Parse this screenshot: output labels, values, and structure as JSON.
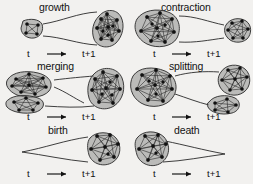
{
  "figure": {
    "caption_absent": true,
    "background_color": "#f2f1ef",
    "ink_color": "#131313",
    "blob_fill": "#9a9a98",
    "panel_count": 6,
    "axis": {
      "start_label": "t",
      "end_label": "t+1",
      "arrow_glyph": "arrow-right-icon"
    },
    "panels": [
      {
        "id": "growth",
        "title": "growth",
        "description": "a small community at time t becomes a larger community at time t+1",
        "clusters_t": 1,
        "clusters_t1": 1,
        "nodes_t": 4,
        "nodes_t1": 11
      },
      {
        "id": "contraction",
        "title": "contraction",
        "description": "a large community at time t becomes a smaller community at time t+1",
        "clusters_t": 1,
        "clusters_t1": 1,
        "nodes_t": 11,
        "nodes_t1": 6
      },
      {
        "id": "merging",
        "title": "merging",
        "description": "two communities at time t combine into one community at time t+1",
        "clusters_t": 2,
        "clusters_t1": 1,
        "nodes_t": 11,
        "nodes_t1": 11
      },
      {
        "id": "splitting",
        "title": "splitting",
        "description": "one community at time t separates into two communities at time t+1",
        "clusters_t": 1,
        "clusters_t1": 2,
        "nodes_t": 11,
        "nodes_t1": 12
      },
      {
        "id": "birth",
        "title": "birth",
        "description": "no community at time t and a new community appears at time t+1",
        "clusters_t": 0,
        "clusters_t1": 1,
        "nodes_t": 0,
        "nodes_t1": 8
      },
      {
        "id": "death",
        "title": "death",
        "description": "a community at time t disappears by time t+1",
        "clusters_t": 1,
        "clusters_t1": 0,
        "nodes_t": 8,
        "nodes_t1": 0
      }
    ]
  }
}
